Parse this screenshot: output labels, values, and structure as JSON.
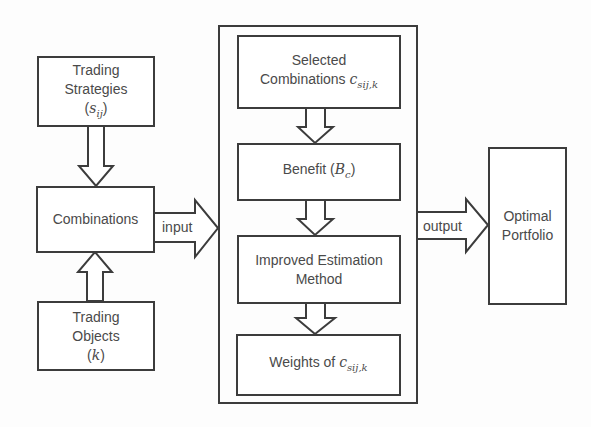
{
  "diagram": {
    "trading_strategies": {
      "line1": "Trading",
      "line2": "Strategies",
      "symbol_open": "(",
      "symbol": "s",
      "symbol_sub": "ij",
      "symbol_close": ")"
    },
    "combinations": {
      "label": "Combinations"
    },
    "trading_objects": {
      "line1": "Trading",
      "line2": "Objects",
      "symbol_open": "(",
      "symbol": "k",
      "symbol_close": ")"
    },
    "input_label": "input",
    "output_label": "output",
    "process": {
      "selected": {
        "line1": "Selected",
        "line2": "Combinations",
        "symbol": "c",
        "symbol_sub": "sij,k"
      },
      "benefit": {
        "label": "Benefit",
        "symbol_open": "(",
        "symbol": "B",
        "symbol_sub": "c",
        "symbol_close": ")"
      },
      "estimation": {
        "line1": "Improved Estimation",
        "line2": "Method"
      },
      "weights": {
        "label": "Weights of",
        "symbol": "c",
        "symbol_sub": "sij,k"
      }
    },
    "optimal_portfolio": {
      "line1": "Optimal",
      "line2": "Portfolio"
    },
    "colors": {
      "stroke": "#3c3c3c",
      "text": "#4a4a4a",
      "background": "#fdfdfd"
    }
  }
}
